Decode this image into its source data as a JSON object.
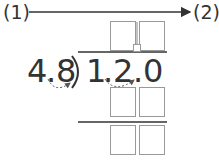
{
  "flow": {
    "start_label": "(1)",
    "end_label": "(2)"
  },
  "division": {
    "divisor": [
      "4",
      ".",
      "8"
    ],
    "dividend": [
      "1",
      ".",
      "2",
      ".",
      "0"
    ],
    "bracket": ")"
  },
  "colors": {
    "text": "#333333",
    "box_border": "#999999",
    "line": "#333333"
  }
}
